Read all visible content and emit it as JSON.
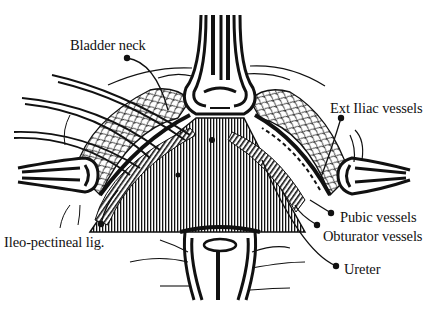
{
  "figure": {
    "type": "anatomical line drawing",
    "colors": {
      "ink": "#111111",
      "background": "#ffffff"
    }
  },
  "labels": [
    {
      "id": "bladder-neck",
      "text": "Bladder neck",
      "x": 70,
      "y": 38,
      "pointer": [
        127,
        58
      ]
    },
    {
      "id": "ext-iliac-vessels",
      "text": "Ext Iliac vessels",
      "x": 330,
      "y": 101,
      "pointer": [
        341,
        118
      ]
    },
    {
      "id": "ileo-pectineal-lig",
      "text": "Ileo-pectineal lig.",
      "x": 4,
      "y": 235,
      "pointer": [
        101,
        224
      ]
    },
    {
      "id": "pubic-vessels",
      "text": "Pubic vessels",
      "x": 340,
      "y": 210,
      "pointer": [
        331,
        213
      ]
    },
    {
      "id": "obturator-vessels",
      "text": "Obturator vessels",
      "x": 323,
      "y": 229,
      "pointer": [
        317,
        225
      ]
    },
    {
      "id": "ureter",
      "text": "Ureter",
      "x": 344,
      "y": 264,
      "pointer": [
        336,
        266
      ]
    }
  ]
}
